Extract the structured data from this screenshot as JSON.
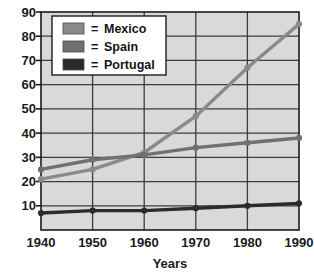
{
  "chart_data": {
    "type": "line",
    "title": "",
    "xlabel": "Years",
    "ylabel": "",
    "x": [
      1940,
      1950,
      1960,
      1970,
      1980,
      1990
    ],
    "categories": [
      "1940",
      "1950",
      "1960",
      "1970",
      "1980",
      "1990"
    ],
    "xlim": [
      1940,
      1990
    ],
    "ylim": [
      0,
      90
    ],
    "yticks": [
      10,
      20,
      30,
      40,
      50,
      60,
      70,
      80,
      90
    ],
    "ytick_labels": [
      "10",
      "20",
      "30",
      "40",
      "50",
      "60",
      "70",
      "80",
      "90"
    ],
    "xtick_labels": [
      "1940",
      "1950",
      "1960",
      "1970",
      "1980",
      "1990"
    ],
    "grid": true,
    "legend_position": "top-left",
    "series": [
      {
        "name": "Mexico",
        "color": "#8a8a8a",
        "values": [
          21,
          25,
          32,
          47,
          67,
          85
        ]
      },
      {
        "name": "Spain",
        "color": "#707070",
        "values": [
          25,
          29,
          31,
          34,
          36,
          38
        ]
      },
      {
        "name": "Portugal",
        "color": "#2b2b2b",
        "values": [
          7,
          8,
          8,
          9,
          10,
          11
        ]
      }
    ]
  },
  "legend": {
    "equals_sign": "=",
    "entries": [
      {
        "label": "Mexico",
        "swatch_color": "#8a8a8a"
      },
      {
        "label": "Spain",
        "swatch_color": "#707070"
      },
      {
        "label": "Portugal",
        "swatch_color": "#2b2b2b"
      }
    ]
  },
  "axes": {
    "x_title": "Years",
    "plot_background": "#d9d9d9",
    "grid_color": "#3d3d3d",
    "frame_color": "#1a1a1a"
  }
}
